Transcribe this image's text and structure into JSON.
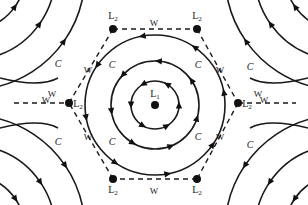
{
  "diagram": {
    "title": "",
    "center_node": {
      "label": "L",
      "subscript": "1"
    },
    "vertex_nodes": [
      {
        "label": "L",
        "subscript": "2",
        "position": "top-left"
      },
      {
        "label": "L",
        "subscript": "2",
        "position": "top-right"
      },
      {
        "label": "L",
        "subscript": "2",
        "position": "right"
      },
      {
        "label": "L",
        "subscript": "2",
        "position": "bottom-right"
      },
      {
        "label": "L",
        "subscript": "2",
        "position": "bottom-left"
      },
      {
        "label": "L",
        "subscript": "2",
        "position": "left"
      }
    ],
    "edge_label": "W",
    "flow_label": "C",
    "w_labels": [
      "W",
      "W",
      "W",
      "W",
      "W",
      "W",
      "W",
      "W",
      "W",
      "W"
    ],
    "c_labels": [
      "C",
      "C",
      "C",
      "C",
      "C",
      "C",
      "C",
      "C"
    ],
    "center_rings": 3,
    "corner_arc_groups": 4,
    "colors": {
      "ink": "#1a1a1a",
      "background": "#ffffff"
    }
  }
}
